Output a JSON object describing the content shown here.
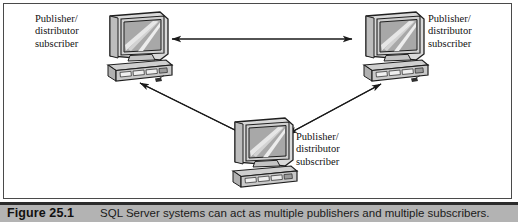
{
  "figure": {
    "caption_label": "Figure 25.1",
    "caption_text": "SQL Server systems can act as multiple publishers and multiple subscribers.",
    "frame_border_color": "#4a4a4a",
    "caption_bar_color": "#b3b3b3",
    "caption_rule_color": "#2b2b2b"
  },
  "diagram": {
    "type": "network-topology",
    "node_icon_name": "desktop-computer-icon",
    "arrow_style": "double-headed",
    "nodes": [
      {
        "id": "node-top-left",
        "icon": "desktop-computer-icon",
        "label_lines": [
          "Publisher/",
          "distributor",
          "subscriber"
        ]
      },
      {
        "id": "node-top-right",
        "icon": "desktop-computer-icon",
        "label_lines": [
          "Publisher/",
          "distributor",
          "subscriber"
        ]
      },
      {
        "id": "node-bottom-center",
        "icon": "desktop-computer-icon",
        "label_lines": [
          "Publisher/",
          "distributor",
          "subscriber"
        ]
      }
    ],
    "connections": [
      {
        "id": "link-topleft-topright",
        "from": "node-top-left",
        "to": "node-top-right",
        "direction": "bidirectional"
      },
      {
        "id": "link-topleft-bottom",
        "from": "node-top-left",
        "to": "node-bottom-center",
        "direction": "bidirectional"
      },
      {
        "id": "link-bottom-topright",
        "from": "node-bottom-center",
        "to": "node-top-right",
        "direction": "bidirectional"
      }
    ]
  }
}
